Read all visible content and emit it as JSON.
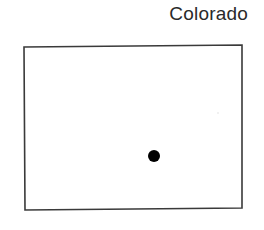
{
  "map": {
    "title": "Colorado",
    "region": {
      "name": "Colorado",
      "shape": "rectangle",
      "outline_color": "#3a3a3a",
      "corners": {
        "top_left": [
          24,
          47
        ],
        "top_right": [
          242,
          45
        ],
        "bottom_right": [
          242,
          208
        ],
        "bottom_left": [
          25,
          210
        ]
      }
    },
    "markers": [
      {
        "type": "dot",
        "x": 154,
        "y": 156,
        "r": 6,
        "color": "#000000"
      }
    ]
  }
}
